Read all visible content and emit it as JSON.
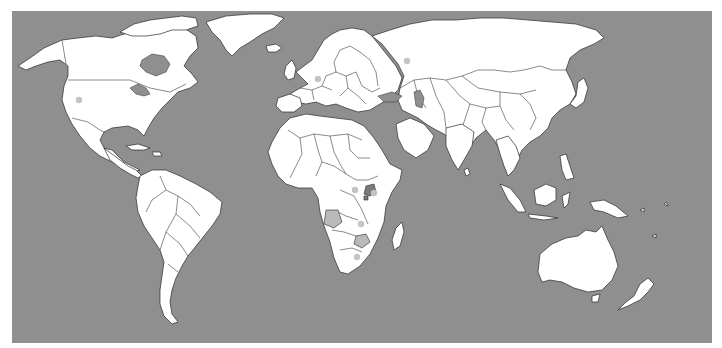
{
  "map": {
    "type": "world-political-outline",
    "projection": "equirectangular-like",
    "colors": {
      "ocean": "#8f8f8f",
      "land": "#ffffff",
      "border": "#2a2a2a",
      "highlight_country": "#b9b9b9",
      "highlight_country_dark": "#7a7a7a",
      "marker": "#c4c4c4"
    },
    "markers": [
      {
        "name": "usa-west",
        "x": 79,
        "y": 100
      },
      {
        "name": "central-europe",
        "x": 318,
        "y": 79
      },
      {
        "name": "russia",
        "x": 407,
        "y": 61
      },
      {
        "name": "central-africa",
        "x": 355,
        "y": 190
      },
      {
        "name": "east-africa",
        "x": 374,
        "y": 193
      },
      {
        "name": "southern-africa-1",
        "x": 361,
        "y": 224
      },
      {
        "name": "south-africa",
        "x": 357,
        "y": 257
      }
    ],
    "highlighted_countries": [
      {
        "name": "uganda",
        "shade": "dark"
      },
      {
        "name": "rwanda",
        "shade": "dark"
      },
      {
        "name": "angola",
        "shade": "light"
      },
      {
        "name": "zimbabwe",
        "shade": "light"
      }
    ]
  }
}
